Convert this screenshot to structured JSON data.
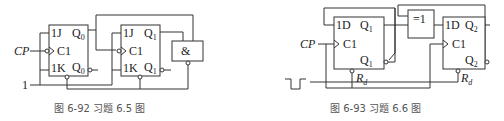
{
  "figure_left": {
    "caption": "图 6-92   习题 6.5 图",
    "input_clock": "CP",
    "input_const": "1",
    "ff0": {
      "j": "1J",
      "clk": "C1",
      "k": "1K",
      "q": "Q",
      "q_sub": "0",
      "qn": "Q",
      "qn_sub": "0",
      "qn_prime": "′"
    },
    "ff1": {
      "j": "1J",
      "clk": "C1",
      "k": "1K",
      "q": "Q",
      "q_sub": "1",
      "qn": "Q",
      "qn_sub": "1",
      "qn_prime": "′"
    },
    "gate": {
      "symbol": "&"
    }
  },
  "figure_right": {
    "caption": "图 6-93   习题 6.6 图",
    "input_clock": "CP",
    "ff1": {
      "d": "1D",
      "clk": "C1",
      "q": "Q",
      "q_sub": "1",
      "qn": "Q",
      "qn_sub": "1",
      "qn_prime": "′",
      "reset": "R",
      "reset_sub": "d"
    },
    "ff2": {
      "d": "1D",
      "clk": "C1",
      "q": "Q",
      "q_sub": "2",
      "qn": "Q",
      "qn_sub": "2",
      "qn_prime": "′",
      "reset": "R",
      "reset_sub": "d"
    },
    "gate": {
      "symbol": "=1"
    }
  }
}
